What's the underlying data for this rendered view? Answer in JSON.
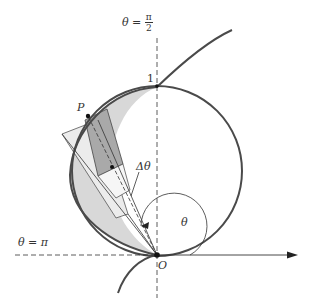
{
  "figure": {
    "labels": {
      "theta_half_pi": {
        "lhs": "θ =",
        "num": "π",
        "den": "2"
      },
      "theta_pi": "θ = π",
      "one": "1",
      "P": "P",
      "delta_theta": "Δθ",
      "theta": "θ",
      "O": "O"
    },
    "colors": {
      "curve": "#4a4a4a",
      "light_fill": "#d8d8d8",
      "dark_fill": "#a8a8a8",
      "sector_fill": "#efefef",
      "axis": "#333333"
    }
  }
}
